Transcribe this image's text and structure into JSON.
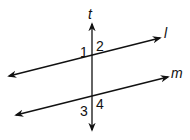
{
  "diagram": {
    "type": "parallel lines cut by transversal",
    "lines": {
      "transversal": {
        "label": "t"
      },
      "line_l": {
        "label": "l"
      },
      "line_m": {
        "label": "m"
      }
    },
    "angles": [
      "1",
      "2",
      "3",
      "4"
    ],
    "colors": {
      "stroke": "#111111",
      "background": "#ffffff"
    }
  }
}
